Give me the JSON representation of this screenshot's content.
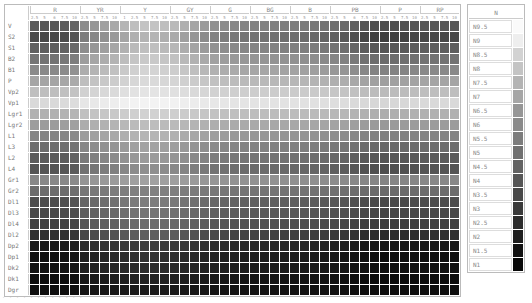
{
  "chart_data": {
    "type": "heatmap",
    "hues": [
      {
        "name": "R",
        "steps": [
          "2.5",
          "5",
          "6",
          "7.5",
          "10"
        ]
      },
      {
        "name": "YR",
        "steps": [
          "2.5",
          "5",
          "7.5",
          "10"
        ]
      },
      {
        "name": "Y",
        "steps": [
          "1",
          "2.5",
          "5",
          "7.5",
          "10"
        ]
      },
      {
        "name": "GY",
        "steps": [
          "2.5",
          "5",
          "7.5",
          "10"
        ]
      },
      {
        "name": "G",
        "steps": [
          "2.5",
          "5",
          "7.5",
          "10"
        ]
      },
      {
        "name": "BG",
        "steps": [
          "2.5",
          "5",
          "7.5",
          "10"
        ]
      },
      {
        "name": "B",
        "steps": [
          "2.5",
          "5",
          "7.5",
          "10"
        ]
      },
      {
        "name": "PB",
        "steps": [
          "2.5",
          "5",
          "6",
          "7.5",
          "10"
        ]
      },
      {
        "name": "P",
        "steps": [
          "2.5",
          "5",
          "7.5",
          "10"
        ]
      },
      {
        "name": "RP",
        "steps": [
          "2.5",
          "5",
          "7.5",
          "10"
        ]
      }
    ],
    "column_offsets": [
      -60,
      -62,
      -62,
      -58,
      -50,
      -10,
      0,
      10,
      18,
      30,
      40,
      45,
      45,
      40,
      35,
      25,
      15,
      5,
      -5,
      -10,
      -15,
      -18,
      -20,
      -20,
      -22,
      -24,
      -25,
      -27,
      -30,
      -35,
      -40,
      -45,
      -55,
      -65,
      -70,
      -72,
      -70,
      -68,
      -65,
      -62,
      -62,
      -62,
      -62
    ],
    "rows": [
      {
        "label": "V",
        "base": 150,
        "amp": 1.0
      },
      {
        "label": "S2",
        "base": 135,
        "amp": 1.0
      },
      {
        "label": "S1",
        "base": 150,
        "amp": 0.9
      },
      {
        "label": "B2",
        "base": 165,
        "amp": 0.8
      },
      {
        "label": "B1",
        "base": 180,
        "amp": 0.7
      },
      {
        "label": "P",
        "base": 195,
        "amp": 0.5
      },
      {
        "label": "Vp2",
        "base": 212,
        "amp": 0.35
      },
      {
        "label": "Vp1",
        "base": 232,
        "amp": 0.25
      },
      {
        "label": "Lgr1",
        "base": 195,
        "amp": 0.3
      },
      {
        "label": "Lgr2",
        "base": 175,
        "amp": 0.3
      },
      {
        "label": "L1",
        "base": 160,
        "amp": 0.45
      },
      {
        "label": "L3",
        "base": 140,
        "amp": 0.5
      },
      {
        "label": "L2",
        "base": 128,
        "amp": 0.6
      },
      {
        "label": "L4",
        "base": 118,
        "amp": 0.55
      },
      {
        "label": "Gr1",
        "base": 150,
        "amp": 0.25
      },
      {
        "label": "Gr2",
        "base": 120,
        "amp": 0.2
      },
      {
        "label": "Dl1",
        "base": 105,
        "amp": 0.45
      },
      {
        "label": "Dl3",
        "base": 98,
        "amp": 0.4
      },
      {
        "label": "Dl4",
        "base": 90,
        "amp": 0.4
      },
      {
        "label": "Dl2",
        "base": 75,
        "amp": 0.45
      },
      {
        "label": "Dp2",
        "base": 45,
        "amp": 0.35
      },
      {
        "label": "Dp1",
        "base": 35,
        "amp": 0.3
      },
      {
        "label": "Dk2",
        "base": 32,
        "amp": 0.25
      },
      {
        "label": "Dk1",
        "base": 25,
        "amp": 0.2
      },
      {
        "label": "Dgr",
        "base": 22,
        "amp": 0.12
      }
    ],
    "neutral": {
      "header": "N",
      "steps": [
        {
          "label": "N9.5",
          "gray": 250
        },
        {
          "label": "N9",
          "gray": 238
        },
        {
          "label": "N8.5",
          "gray": 210
        },
        {
          "label": "N8",
          "gray": 196
        },
        {
          "label": "N7.5",
          "gray": 180
        },
        {
          "label": "N7",
          "gray": 166
        },
        {
          "label": "N6.5",
          "gray": 150
        },
        {
          "label": "N6",
          "gray": 138
        },
        {
          "label": "N5.5",
          "gray": 124
        },
        {
          "label": "N5",
          "gray": 112
        },
        {
          "label": "N4.5",
          "gray": 98
        },
        {
          "label": "N4",
          "gray": 86
        },
        {
          "label": "N3.5",
          "gray": 72
        },
        {
          "label": "N3",
          "gray": 58
        },
        {
          "label": "N2.5",
          "gray": 44
        },
        {
          "label": "N2",
          "gray": 30
        },
        {
          "label": "N1.5",
          "gray": 18
        },
        {
          "label": "N1",
          "gray": 8
        }
      ]
    },
    "grid": true,
    "legend": "none"
  },
  "footer": {
    "caption": "· · · · · · · · · · · ·"
  }
}
